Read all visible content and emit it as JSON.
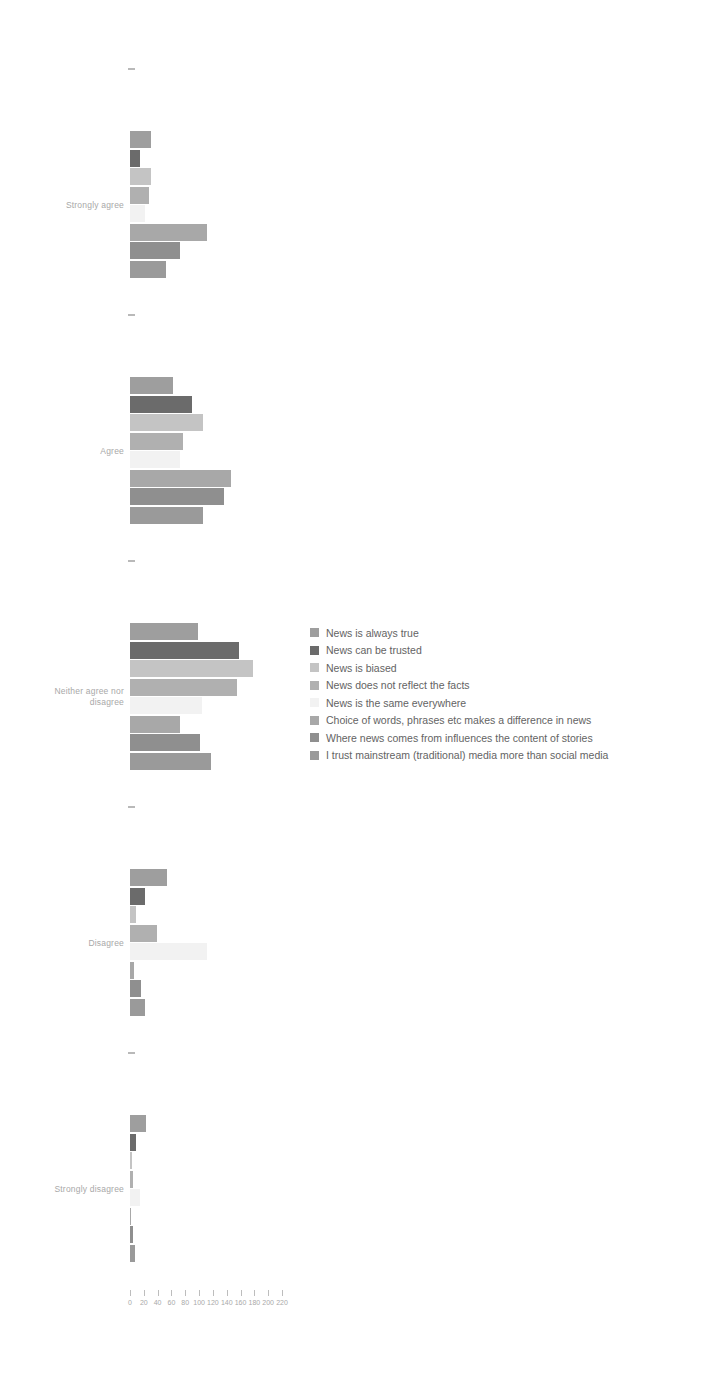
{
  "chart_data": {
    "type": "bar",
    "orientation": "horizontal",
    "grouped": true,
    "title": "",
    "subtitle": "",
    "xlabel": "",
    "ylabel": "",
    "xlim": [
      0,
      220
    ],
    "grid": false,
    "legend_position": "center-right",
    "xticks": [
      0,
      20,
      40,
      60,
      80,
      100,
      120,
      140,
      160,
      180,
      200,
      220
    ],
    "xtick_labels": [
      "0",
      "20",
      "40",
      "60",
      "80",
      "100",
      "120",
      "140",
      "160",
      "180",
      "200",
      "220"
    ],
    "categories": [
      "Strongly agree",
      "Agree",
      "Neither agree nor\ndisagree",
      "Disagree",
      "Strongly disagree"
    ],
    "series": [
      {
        "name": "News is always true",
        "color": "#9e9e9e",
        "values": [
          30,
          62,
          99,
          53,
          23
        ]
      },
      {
        "name": "News can be trusted",
        "color": "#6b6b6b",
        "values": [
          15,
          90,
          158,
          21,
          9
        ]
      },
      {
        "name": "News is biased",
        "color": "#c4c4c4",
        "values": [
          30,
          105,
          178,
          8,
          3
        ]
      },
      {
        "name": "News does not reflect the facts",
        "color": "#b0b0b0",
        "values": [
          28,
          77,
          155,
          39,
          5
        ]
      },
      {
        "name": "News is the same everywhere",
        "color": "#f2f2f2",
        "values": [
          21,
          72,
          104,
          112,
          14
        ]
      },
      {
        "name": "Choice of words, phrases etc makes a difference in news",
        "color": "#a8a8a8",
        "values": [
          112,
          146,
          72,
          6,
          2
        ]
      },
      {
        "name": "Where news comes from influences the content of stories",
        "color": "#8f8f8f",
        "values": [
          73,
          136,
          101,
          16,
          4
        ]
      },
      {
        "name": "I trust mainstream (traditional) media more than social media",
        "color": "#9a9a9a",
        "values": [
          52,
          105,
          117,
          22,
          7
        ]
      }
    ]
  },
  "legend": {
    "items": [
      {
        "label": "News is always true"
      },
      {
        "label": "News can be trusted"
      },
      {
        "label": "News is biased"
      },
      {
        "label": "News does not reflect the facts"
      },
      {
        "label": "News is the same everywhere"
      },
      {
        "label": "Choice of words, phrases etc makes a difference in news"
      },
      {
        "label": "Where news comes from influences the content of stories"
      },
      {
        "label": "I trust mainstream (traditional) media more than social media"
      }
    ]
  },
  "axis": {
    "y_labels": [
      "Strongly agree",
      "Agree",
      "Neither agree nor\ndisagree",
      "Disagree",
      "Strongly disagree"
    ],
    "x_labels": [
      "0",
      "20",
      "40",
      "60",
      "80",
      "100",
      "120",
      "140",
      "160",
      "180",
      "200",
      "220"
    ]
  }
}
